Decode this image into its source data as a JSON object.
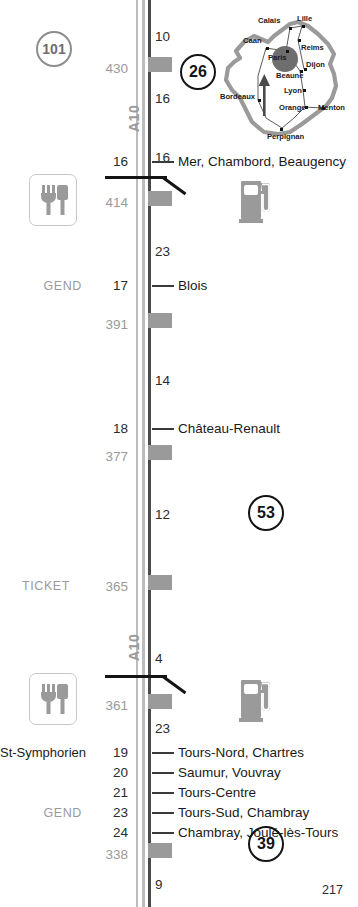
{
  "page": {
    "number": "217",
    "motorway_label": "A10",
    "road_color": "#bcbcbc",
    "accent_dark": "#141414",
    "accent_grey": "#9a9a9a"
  },
  "badges": [
    {
      "name": "page-badge-101",
      "value": "101",
      "style": "grey",
      "x": 36,
      "y": 31,
      "size": 36
    },
    {
      "name": "page-badge-26",
      "value": "26",
      "style": "dark",
      "x": 180,
      "y": 54,
      "size": 36
    },
    {
      "name": "page-badge-53",
      "value": "53",
      "style": "dark",
      "x": 248,
      "y": 495,
      "size": 36
    },
    {
      "name": "page-badge-39",
      "value": "39",
      "style": "dark",
      "x": 248,
      "y": 826,
      "size": 36
    }
  ],
  "motorway_labels": [
    {
      "text": "A10",
      "x": 126,
      "y": 132
    },
    {
      "text": "A10",
      "x": 126,
      "y": 661
    }
  ],
  "km_markers": [
    {
      "value": "430",
      "y": 62
    },
    {
      "value": "414",
      "y": 196
    },
    {
      "value": "391",
      "y": 318
    },
    {
      "value": "377",
      "y": 450
    },
    {
      "value": "365",
      "y": 580
    },
    {
      "value": "361",
      "y": 699
    },
    {
      "value": "338",
      "y": 848
    }
  ],
  "segment_distances": [
    {
      "value": "10",
      "y": 30
    },
    {
      "value": "16",
      "y": 92
    },
    {
      "value": "16",
      "y": 151
    },
    {
      "value": "23",
      "y": 245
    },
    {
      "value": "14",
      "y": 374
    },
    {
      "value": "12",
      "y": 508
    },
    {
      "value": "4",
      "y": 652
    },
    {
      "value": "23",
      "y": 722
    },
    {
      "value": "9",
      "y": 878
    }
  ],
  "exits": [
    {
      "number": "16",
      "destination": "Mer, Chambord, Beaugency",
      "left_label": "",
      "gend": false,
      "y": 155
    },
    {
      "number": "17",
      "destination": "Blois",
      "left_label": "",
      "gend": true,
      "y": 279
    },
    {
      "number": "18",
      "destination": "Château-Renault",
      "left_label": "",
      "gend": false,
      "y": 422
    },
    {
      "number": "19",
      "destination": "Tours-Nord, Chartres",
      "left_label": "St-Symphorien",
      "gend": false,
      "y": 746
    },
    {
      "number": "20",
      "destination": "Saumur, Vouvray",
      "left_label": "",
      "gend": false,
      "y": 766
    },
    {
      "number": "21",
      "destination": "Tours-Centre",
      "left_label": "",
      "gend": false,
      "y": 786
    },
    {
      "number": "23",
      "destination": "Tours-Sud, Chambray",
      "left_label": "",
      "gend": true,
      "y": 806
    },
    {
      "number": "24",
      "destination": "Chambray, Joulé-lès-Tours",
      "left_label": "",
      "gend": false,
      "y": 826
    }
  ],
  "service_blocks": [
    {
      "y": 57
    },
    {
      "y": 191
    },
    {
      "y": 313
    },
    {
      "y": 445
    },
    {
      "y": 575
    },
    {
      "y": 694
    },
    {
      "y": 843
    }
  ],
  "ticket_label": {
    "text": "TICKET",
    "x": 33,
    "y": 580
  },
  "rest_areas": [
    {
      "name": "rest-area-connector-upper",
      "y": 176,
      "restaurant_y": 174,
      "fuel_y": 175
    },
    {
      "name": "rest-area-connector-lower",
      "y": 675,
      "restaurant_y": 673,
      "fuel_y": 674
    }
  ],
  "pictograms": [
    {
      "name": "restaurant-icon",
      "x": 29,
      "y": 174
    },
    {
      "name": "fuel-icon",
      "x": 239,
      "y": 175
    },
    {
      "name": "restaurant-icon",
      "x": 29,
      "y": 673
    },
    {
      "name": "fuel-icon",
      "x": 239,
      "y": 674
    }
  ],
  "france_map": {
    "title": "france-overview-map",
    "highlight_city": "Paris",
    "cities": [
      {
        "name": "Calais",
        "lx": 52,
        "ly": 10,
        "dx": 83,
        "dy": 21
      },
      {
        "name": "Lille",
        "lx": 91,
        "ly": 8,
        "dx": 96,
        "dy": 19
      },
      {
        "name": "Caan",
        "lx": 37,
        "ly": 30,
        "dx": 60,
        "dy": 41
      },
      {
        "name": "Reims",
        "lx": 95,
        "ly": 37,
        "dx": 92,
        "dy": 33
      },
      {
        "name": "Paris",
        "lx": 62,
        "ly": 47,
        "dx": 80,
        "dy": 44
      },
      {
        "name": "Dijon",
        "lx": 100,
        "ly": 54,
        "dx": 98,
        "dy": 62
      },
      {
        "name": "Beaune",
        "lx": 70,
        "ly": 65,
        "dx": 94,
        "dy": 64
      },
      {
        "name": "Bordeaux",
        "lx": 14,
        "ly": 86,
        "dx": 52,
        "dy": 93
      },
      {
        "name": "Lyon",
        "lx": 78,
        "ly": 80,
        "dx": 97,
        "dy": 83
      },
      {
        "name": "Orange",
        "lx": 73,
        "ly": 97,
        "dx": 99,
        "dy": 100
      },
      {
        "name": "Menton",
        "lx": 112,
        "ly": 97,
        "dx": 116,
        "dy": 101
      },
      {
        "name": "Perpignan",
        "lx": 61,
        "ly": 126,
        "dx": 74,
        "dy": 122
      }
    ]
  }
}
